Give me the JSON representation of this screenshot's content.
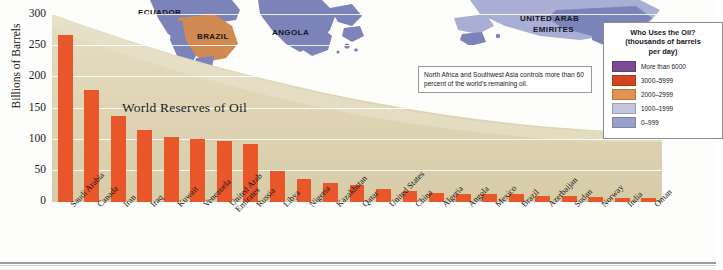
{
  "chart_data": {
    "type": "bar",
    "title": "World Reserves of Oil",
    "xlabel": "",
    "ylabel": "Billions of Barrels",
    "ylim": [
      0,
      300
    ],
    "yticks": [
      0,
      50,
      100,
      150,
      200,
      250,
      300
    ],
    "grid": true,
    "bar_color": "#e8562a",
    "categories": [
      "Saudi Arabia",
      "Canada",
      "Iran",
      "Iraq",
      "Kuwait",
      "Venezuela",
      "United Arab Emirates",
      "Russia",
      "Libya",
      "Nigeria",
      "Kazakhstan",
      "Qatar",
      "United States",
      "China",
      "Algeria",
      "Angola",
      "Mexico",
      "Brazil",
      "Azerbaijan",
      "Sudan",
      "Norway",
      "India",
      "Oman"
    ],
    "values": [
      267,
      179,
      138,
      115,
      104,
      100,
      98,
      93,
      49,
      37,
      30,
      27,
      21,
      18,
      15,
      13,
      12,
      12,
      10,
      9,
      8,
      7,
      6
    ],
    "annotation": "North Africa and Southwest Asia controls more than 60 percent of the world's remaining oil."
  },
  "map": {
    "labels": [
      {
        "name": "ECUADOR",
        "x": 138,
        "y": 8
      },
      {
        "name": "BRAZIL",
        "x": 197,
        "y": 32
      },
      {
        "name": "ANGOLA",
        "x": 272,
        "y": 28
      },
      {
        "name": "UNITED ARAB",
        "x": 520,
        "y": 14
      },
      {
        "name": "EMIRITES",
        "x": 533,
        "y": 25
      }
    ],
    "land_color": "#7b83b8",
    "highlight_color": "#d08a52"
  },
  "legend": {
    "title_line1": "Who Uses the Oil?",
    "title_line2": "(thousands of barrels",
    "title_line3": "per day)",
    "items": [
      {
        "label": "More than 6000",
        "color": "#7b4a92"
      },
      {
        "label": "3000–5999",
        "color": "#d2451f"
      },
      {
        "label": "2000–2999",
        "color": "#e0944f"
      },
      {
        "label": "1000–1999",
        "color": "#c3c5de"
      },
      {
        "label": "0–999",
        "color": "#9aa0c9"
      }
    ]
  },
  "axis": {
    "tick_labels": [
      "300",
      "250",
      "200",
      "150",
      "100",
      "50",
      "0"
    ]
  }
}
